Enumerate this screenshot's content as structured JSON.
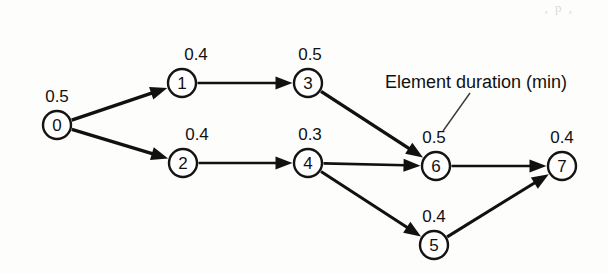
{
  "figure": {
    "type": "precedence-network-diagram",
    "background_color": "#fdfdfc",
    "stroke_color": "#111111",
    "top_bleed_text": ", p ,"
  },
  "annotation": {
    "label": "Element duration (min)",
    "x": 385,
    "y": 88,
    "leader": {
      "x1": 470,
      "y1": 93,
      "x2": 443,
      "y2": 131
    }
  },
  "chart_data": {
    "type": "diagram",
    "title": "Element duration (min)",
    "nodes": [
      {
        "id": "0",
        "label": "0",
        "duration": "0.5",
        "cx": 57,
        "cy": 125,
        "r": 14,
        "dur_x": 57,
        "dur_y": 102
      },
      {
        "id": "1",
        "label": "1",
        "duration": "0.4",
        "cx": 182,
        "cy": 83,
        "r": 14,
        "dur_x": 196,
        "dur_y": 60
      },
      {
        "id": "2",
        "label": "2",
        "duration": "0.4",
        "cx": 183,
        "cy": 163,
        "r": 14,
        "dur_x": 197,
        "dur_y": 140
      },
      {
        "id": "3",
        "label": "3",
        "duration": "0.5",
        "cx": 308,
        "cy": 83,
        "r": 14,
        "dur_x": 310,
        "dur_y": 60
      },
      {
        "id": "4",
        "label": "4",
        "duration": "0.3",
        "cx": 308,
        "cy": 163,
        "r": 14,
        "dur_x": 310,
        "dur_y": 140
      },
      {
        "id": "5",
        "label": "5",
        "duration": "0.4",
        "cx": 434,
        "cy": 245,
        "r": 14,
        "dur_x": 434,
        "dur_y": 222
      },
      {
        "id": "6",
        "label": "6",
        "duration": "0.5",
        "cx": 436,
        "cy": 166,
        "r": 14,
        "dur_x": 434,
        "dur_y": 143
      },
      {
        "id": "7",
        "label": "7",
        "duration": "0.4",
        "cx": 562,
        "cy": 166,
        "r": 14,
        "dur_x": 562,
        "dur_y": 143
      }
    ],
    "edges": [
      {
        "from": "0",
        "to": "1",
        "width": 3.4
      },
      {
        "from": "0",
        "to": "2",
        "width": 3.4
      },
      {
        "from": "1",
        "to": "3",
        "width": 2.6
      },
      {
        "from": "2",
        "to": "4",
        "width": 2.6
      },
      {
        "from": "3",
        "to": "6",
        "width": 3.4
      },
      {
        "from": "4",
        "to": "6",
        "width": 2.6
      },
      {
        "from": "4",
        "to": "5",
        "width": 3.0
      },
      {
        "from": "6",
        "to": "7",
        "width": 2.6
      },
      {
        "from": "5",
        "to": "7",
        "width": 3.0
      }
    ]
  }
}
